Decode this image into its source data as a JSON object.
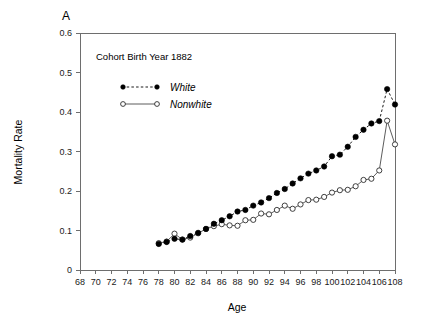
{
  "panel": {
    "label": "A"
  },
  "annotation": {
    "cohort_text": "Cohort Birth Year 1882"
  },
  "axes": {
    "x_title": "Age",
    "y_title": "Mortality Rate",
    "x_ticks": [
      "68",
      "70",
      "72",
      "74",
      "76",
      "78",
      "80",
      "82",
      "84",
      "86",
      "88",
      "90",
      "92",
      "94",
      "96",
      "98",
      "100",
      "102",
      "104",
      "106",
      "108"
    ],
    "y_ticks": [
      "0",
      "0.1",
      "0.2",
      "0.3",
      "0.4",
      "0.5",
      "0.6"
    ]
  },
  "legend": {
    "entries": [
      {
        "label": "White",
        "marker": "filled-circle",
        "line": "dashed",
        "color": "#000000"
      },
      {
        "label": "Nonwhite",
        "marker": "open-circle",
        "line": "solid",
        "color": "#2b2b2b"
      }
    ]
  },
  "chart_data": {
    "type": "line",
    "title": "Cohort Birth Year 1882",
    "panel_label": "A",
    "xlabel": "Age",
    "ylabel": "Mortality Rate",
    "xlim": [
      68,
      108
    ],
    "ylim": [
      0,
      0.6
    ],
    "xtick_step": 2,
    "ytick_step": 0.1,
    "grid": false,
    "legend_position": "upper-left-inset",
    "x": [
      78,
      79,
      80,
      81,
      82,
      83,
      84,
      85,
      86,
      87,
      88,
      89,
      90,
      91,
      92,
      93,
      94,
      95,
      96,
      97,
      98,
      99,
      100,
      101,
      102,
      103,
      104,
      105,
      106,
      107,
      108
    ],
    "series": [
      {
        "name": "White",
        "marker": "filled-circle",
        "linestyle": "dashed",
        "color": "#000000",
        "values": [
          0.066,
          0.071,
          0.079,
          0.077,
          0.086,
          0.094,
          0.104,
          0.117,
          0.126,
          0.136,
          0.148,
          0.152,
          0.163,
          0.171,
          0.182,
          0.195,
          0.205,
          0.219,
          0.232,
          0.244,
          0.252,
          0.262,
          0.288,
          0.292,
          0.312,
          0.337,
          0.355,
          0.371,
          0.377,
          0.375,
          0.369
        ]
      },
      {
        "name": "Nonwhite",
        "marker": "open-circle",
        "linestyle": "solid",
        "color": "#2b2b2b",
        "values": [
          0.068,
          0.072,
          0.092,
          0.077,
          0.082,
          0.093,
          0.104,
          0.111,
          0.116,
          0.113,
          0.112,
          0.126,
          0.127,
          0.143,
          0.141,
          0.152,
          0.163,
          0.155,
          0.166,
          0.177,
          0.178,
          0.185,
          0.196,
          0.202,
          0.203,
          0.212,
          0.228,
          0.231,
          0.252,
          0.281,
          0.304
        ]
      }
    ],
    "tail_overlay": {
      "description": "Sharp terminal spike at the oldest ages",
      "x": [
        106,
        107,
        108
      ],
      "white_values": [
        0.377,
        0.458,
        0.419
      ],
      "nonwhite_values": [
        0.252,
        0.378,
        0.318
      ]
    }
  }
}
